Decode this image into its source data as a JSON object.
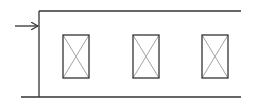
{
  "diagram": {
    "colors": {
      "background": "#ffffff",
      "stroke": "#333333",
      "cross": "#8a8a8a"
    },
    "boundary": {
      "top_line": {
        "x1": 39,
        "y1": 11,
        "x2": 241,
        "y2": 11
      },
      "bottom_line": {
        "x1": 21,
        "y1": 97,
        "x2": 241,
        "y2": 97
      },
      "left_wall": {
        "x1": 39,
        "y1": 11,
        "x2": 39,
        "y2": 97
      }
    },
    "arrow": {
      "x1": 15,
      "y1": 26,
      "x2": 38,
      "y2": 26,
      "direction": "right"
    },
    "boxes": [
      {
        "x": 63,
        "y": 35,
        "w": 26,
        "h": 43
      },
      {
        "x": 133,
        "y": 35,
        "w": 26,
        "h": 43
      },
      {
        "x": 202,
        "y": 35,
        "w": 26,
        "h": 43
      }
    ]
  }
}
